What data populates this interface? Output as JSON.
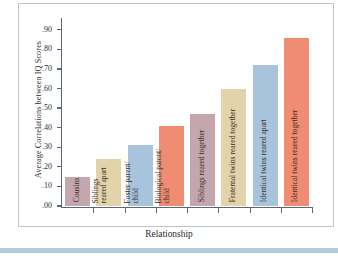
{
  "chart_data": {
    "type": "bar",
    "title": "",
    "xlabel": "Relationship",
    "ylabel": "Average Correlations between IQ Scores",
    "ylim": [
      0.0,
      0.95
    ],
    "grid": false,
    "legend": "none",
    "ytick_labels": [
      ".90",
      ".80",
      ".70",
      ".60",
      ".50",
      ".40",
      ".30",
      ".20",
      ".10",
      ".00"
    ],
    "ytick_values": [
      0.9,
      0.8,
      0.7,
      0.6,
      0.5,
      0.4,
      0.3,
      0.2,
      0.1,
      0.0
    ],
    "categories": [
      "Cousins",
      "Siblings reared apart",
      "Foster parent/child",
      "Biological parent/child",
      "Siblings reared together",
      "Fraternal twins reared together",
      "Identical twins reared apart",
      "Identical twins reared together"
    ],
    "values": [
      0.15,
      0.24,
      0.31,
      0.41,
      0.47,
      0.6,
      0.72,
      0.86
    ],
    "bar_colors": [
      "#c4a6ae",
      "#e3d3ab",
      "#a8c4dc",
      "#ef8c72",
      "#c4a6ae",
      "#e3d3ab",
      "#a8c4dc",
      "#ef8c72"
    ],
    "bars": [
      {
        "label_line1": "Cousins",
        "label_line2": "",
        "value": 0.15,
        "color": "#c4a6ae"
      },
      {
        "label_line1": "Siblings",
        "label_line2": "reared apart",
        "value": 0.24,
        "color": "#e3d3ab"
      },
      {
        "label_line1": "Foster parent/",
        "label_line2": "child",
        "value": 0.31,
        "color": "#a8c4dc"
      },
      {
        "label_line1": "Biological parent/",
        "label_line2": "child",
        "value": 0.41,
        "color": "#ef8c72"
      },
      {
        "label_line1": "Siblings reared together",
        "label_line2": "",
        "value": 0.47,
        "color": "#c4a6ae"
      },
      {
        "label_line1": "Fraternal twins reared together",
        "label_line2": "",
        "value": 0.6,
        "color": "#e3d3ab"
      },
      {
        "label_line1": "Identical twins reared apart",
        "label_line2": "",
        "value": 0.72,
        "color": "#a8c4dc"
      },
      {
        "label_line1": "Identical twins reared together",
        "label_line2": "",
        "value": 0.86,
        "color": "#ef8c72"
      }
    ]
  },
  "colors": {
    "axis": "#5a6676",
    "frame": "#b9c4cc",
    "band": "#b3cddc",
    "text": "#2b2b2b",
    "bar_text": "#3a2a22"
  }
}
